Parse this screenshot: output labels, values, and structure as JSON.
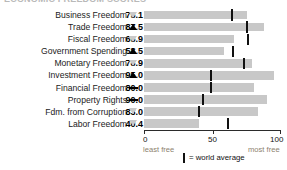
{
  "title": "ECONOMIC FREEDOM SCORES",
  "chart_data": {
    "type": "bar",
    "title": "Economic Freedom Scores",
    "xlabel": "",
    "ylabel": "",
    "xlim": [
      0,
      100
    ],
    "grid": false,
    "legend_position": "bottom",
    "categories": [
      "Business Freedom",
      "Trade Freedom",
      "Fiscal Freedom",
      "Government Spending",
      "Monetary Freedom",
      "Investment Freedom",
      "Financial Freedom",
      "Property Rights",
      "Fdm. from Corruption",
      "Labor Freedom"
    ],
    "values": [
      75.1,
      87.5,
      65.9,
      58.5,
      78.9,
      95.0,
      80.0,
      90.0,
      83.0,
      40.4
    ],
    "value_labels": [
      "75.1",
      "87.5",
      "65.9",
      "58.5",
      "78.9",
      "95.0",
      "80.0",
      "90.0",
      "83.0",
      "40.4"
    ],
    "trends": [
      "down",
      "up",
      "down",
      "up",
      "down",
      "up",
      "flat",
      "flat",
      "down",
      "down"
    ],
    "world_average": [
      64,
      75,
      76,
      65,
      73,
      49,
      49,
      43,
      40,
      61
    ],
    "ticks": [
      0,
      50,
      100
    ],
    "tick_labels": [
      "0",
      "50",
      "100"
    ],
    "axis_end_low": "least free",
    "axis_end_high": "most free",
    "legend_label": "= world average",
    "colors": {
      "bar": "#c8c8c8",
      "world_average_tick": "#111111",
      "trend_up": "#000000",
      "trend_down": "#c9c9c9",
      "axis": "#2b2b2b",
      "axis_end_text": "#8d7f6e"
    }
  },
  "rows": [
    {
      "label": "Business Freedom",
      "value": "75.1"
    },
    {
      "label": "Trade Freedom",
      "value": "87.5"
    },
    {
      "label": "Fiscal Freedom",
      "value": "65.9"
    },
    {
      "label": "Government Spending",
      "value": "58.5"
    },
    {
      "label": "Monetary Freedom",
      "value": "78.9"
    },
    {
      "label": "Investment Freedom",
      "value": "95.0"
    },
    {
      "label": "Financial Freedom",
      "value": "80.0"
    },
    {
      "label": "Property Rights",
      "value": "90.0"
    },
    {
      "label": "Fdm. from Corruption",
      "value": "83.0"
    },
    {
      "label": "Labor Freedom",
      "value": "40.4"
    }
  ],
  "axis": {
    "tick0": "0",
    "tick50": "50",
    "tick100": "100",
    "least": "least free",
    "most": "most free"
  },
  "legend": {
    "text": "= world average"
  }
}
